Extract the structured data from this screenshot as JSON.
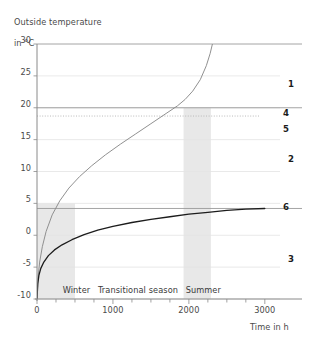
{
  "chart_data": {
    "type": "line",
    "title": "Outside temperature\nin °C",
    "ylabel": "Outside temperature in °C",
    "xlabel": "Time in h",
    "xlim": [
      0,
      3200
    ],
    "ylim": [
      -10,
      30
    ],
    "grid": true,
    "legend_position": "right",
    "yticks": [
      "30",
      "25",
      "20",
      "15",
      "10",
      "5",
      "0",
      "-5",
      "-10"
    ],
    "ytick_values": [
      30,
      25,
      20,
      15,
      10,
      5,
      0,
      -5,
      -10
    ],
    "xticks": [
      "0",
      "1000",
      "2000",
      "3000"
    ],
    "xtick_values": [
      0,
      1000,
      2000,
      3000
    ],
    "xminor_step": 250,
    "series": [
      {
        "name": "1",
        "label": "1",
        "style": "curve-gray",
        "color": "#8a8a8a",
        "description": "Rising outside temperature curve from -10 °C to 30 °C",
        "points": [
          [
            0,
            -10
          ],
          [
            15,
            -6.5
          ],
          [
            35,
            -4.2
          ],
          [
            70,
            -1.8
          ],
          [
            120,
            0.6
          ],
          [
            200,
            3.2
          ],
          [
            300,
            5.4
          ],
          [
            420,
            7.4
          ],
          [
            560,
            9.2
          ],
          [
            720,
            10.9
          ],
          [
            900,
            12.6
          ],
          [
            1100,
            14.3
          ],
          [
            1300,
            15.9
          ],
          [
            1500,
            17.5
          ],
          [
            1700,
            19.1
          ],
          [
            1850,
            20.3
          ],
          [
            1950,
            21.3
          ],
          [
            2050,
            22.6
          ],
          [
            2150,
            24.4
          ],
          [
            2230,
            26.6
          ],
          [
            2280,
            28.5
          ],
          [
            2310,
            30.0
          ]
        ]
      },
      {
        "name": "2",
        "label": "2",
        "style": "annotation",
        "color": "#1c1c1c",
        "description": "Region label between curves"
      },
      {
        "name": "3",
        "label": "3",
        "style": "annotation",
        "color": "#1c1c1c",
        "description": "Region label below lower curve"
      },
      {
        "name": "4",
        "label": "4",
        "style": "horizontal-solid",
        "color": "#9a9a9a",
        "value": 20,
        "description": "Solid reference line at 20 °C"
      },
      {
        "name": "5",
        "label": "5",
        "style": "horizontal-dotted",
        "color": "#b0b0b0",
        "value": 18.7,
        "description": "Dotted reference line just under 20 °C"
      },
      {
        "name": "6",
        "label": "6",
        "style": "curve-dark",
        "color": "#1c1c1c",
        "value": 4.2,
        "description": "Lower saturating curve approaching ~4 °C",
        "points": [
          [
            0,
            -10
          ],
          [
            10,
            -7.6
          ],
          [
            25,
            -6.3
          ],
          [
            50,
            -5.2
          ],
          [
            90,
            -4.2
          ],
          [
            150,
            -3.2
          ],
          [
            230,
            -2.3
          ],
          [
            330,
            -1.5
          ],
          [
            460,
            -0.7
          ],
          [
            620,
            0.1
          ],
          [
            800,
            0.8
          ],
          [
            1000,
            1.4
          ],
          [
            1250,
            2.0
          ],
          [
            1500,
            2.5
          ],
          [
            1750,
            2.9
          ],
          [
            2000,
            3.3
          ],
          [
            2250,
            3.6
          ],
          [
            2500,
            3.9
          ],
          [
            2750,
            4.1
          ],
          [
            3000,
            4.2
          ]
        ]
      }
    ],
    "reference_lines": [
      {
        "name": "top-border",
        "value": 30,
        "style": "solid",
        "color": "#9a9a9a"
      },
      {
        "name": "line-4",
        "value": 20,
        "style": "solid",
        "color": "#9a9a9a"
      },
      {
        "name": "line-5",
        "value": 18.7,
        "style": "dotted",
        "color": "#b3b3b3"
      },
      {
        "name": "line-6",
        "value": 4.2,
        "style": "solid",
        "color": "#9a9a9a"
      }
    ],
    "bands": [
      {
        "name": "winter",
        "label": "Winter",
        "x0": 0,
        "x1": 500,
        "y0": -10,
        "y1": 5,
        "color": "#e8e8e8"
      },
      {
        "name": "summer",
        "label": "Summer",
        "x0": 1930,
        "x1": 2290,
        "y0": -10,
        "y1": 20,
        "color": "#e8e8e8"
      }
    ],
    "season_labels": [
      {
        "name": "winter",
        "text": "Winter",
        "x": 520
      },
      {
        "name": "transitional",
        "text": "Transitional season",
        "x": 1330
      },
      {
        "name": "summer",
        "text": "Summer",
        "x": 2190
      }
    ],
    "curve_labels": [
      {
        "name": "1",
        "text": "1",
        "px": 288,
        "py": 79
      },
      {
        "name": "4",
        "text": "4",
        "px": 283,
        "py": 108
      },
      {
        "name": "5",
        "text": "5",
        "px": 283,
        "py": 124
      },
      {
        "name": "2",
        "text": "2",
        "px": 288,
        "py": 154
      },
      {
        "name": "6",
        "text": "6",
        "px": 283,
        "py": 202
      },
      {
        "name": "3",
        "text": "3",
        "px": 288,
        "py": 254
      }
    ]
  },
  "labels": {
    "y_axis_title_line1": "Outside temperature",
    "y_axis_title_line2": "in °C",
    "x_axis_caption": "Time in h"
  }
}
